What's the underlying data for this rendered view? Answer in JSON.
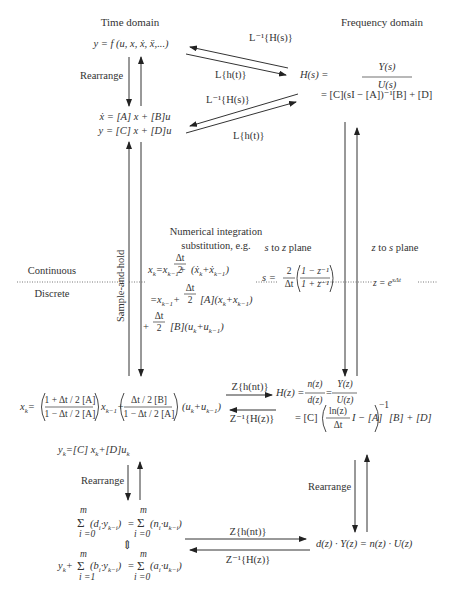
{
  "headers": {
    "time_domain": "Time domain",
    "frequency_domain": "Frequency domain"
  },
  "time_domain": {
    "ode": "y = f (u, x, ẋ, ẍ,...)",
    "state_space_1": "ẋ = [A] x + [B]u",
    "state_space_2": "y = [C] x + [D]u",
    "rearrange": "Rearrange"
  },
  "frequency_domain": {
    "transfer_function_lhs": "H(s) =",
    "transfer_function_num": "Y(s)",
    "transfer_function_den": "U(s)",
    "state_space_tf": "= [C](sI − [A])⁻¹[B] + [D]"
  },
  "laplace_arrows": {
    "top_inverse": "L⁻¹{H(s)}",
    "top_forward": "L{h(t)}",
    "bottom_inverse": "L⁻¹{H(s)}",
    "bottom_forward": "L{h(t)}"
  },
  "boundary": {
    "continuous": "Continuous",
    "discrete": "Discrete",
    "sample_and_hold": "Sample-and-hold"
  },
  "numerical_integration": {
    "title_1": "Numerical integration",
    "title_2": "substitution, e.g.",
    "eq1": "x_k = x_{k−1} + Δt/2 (ẋ_k + ẋ_{k−1})",
    "eq1_lhs": "x",
    "eq1_rest_a": " = x",
    "eq1_rest_b": " + ",
    "eq1_tail": "(ẋ",
    "eq2_a": "= x",
    "eq2_tail": "[A](x",
    "eq3_tail": "[B](u",
    "frac_num": "Δt",
    "frac_den": "2"
  },
  "s_to_z": {
    "label": "s to z plane",
    "eq_lhs": "s =",
    "frac_num": "2",
    "frac_den": "Δt",
    "inner_num": "1 − z⁻¹",
    "inner_den": "1 + z⁻¹"
  },
  "z_to_s": {
    "label": "z to s plane",
    "eq": "z = e",
    "eq_exp": "sΔt"
  },
  "discrete_state": {
    "xk_lhs": "x",
    "frac1_num": "1 + Δt / 2 [A]",
    "frac1_den": "1 − Δt / 2 [A]",
    "mid": "x",
    "frac2_num": "Δt / 2 [B]",
    "frac2_den": "1 − Δt / 2 [A]",
    "tail": "(u",
    "output_eq": "y_k = [C] x_k + [D]u_k"
  },
  "z_arrows": {
    "top_forward": "Z{h(nt)}",
    "top_inverse": "Z⁻¹{H(z)}",
    "bottom_forward": "Z{h(nt)}",
    "bottom_inverse": "Z⁻¹{H(z)}"
  },
  "z_domain": {
    "hz_lhs": "H(z) =",
    "hz_frac1_num": "n(z)",
    "hz_frac1_den": "d(z)",
    "hz_frac2_num": "Y(z)",
    "hz_frac2_den": "U(z)",
    "hz_ss_lead": "= [C]",
    "hz_ss_frac_num": "ln(z)",
    "hz_ss_frac_den": "Δt",
    "hz_ss_mid": "I − [A]",
    "hz_ss_exp": "−1",
    "hz_ss_tail": "[B] + [D]",
    "rearrange": "Rearrange",
    "poly_eq": "d(z) · Y(z) = n(z) · U(z)"
  },
  "difference_eq": {
    "rearrange": "Rearrange",
    "sum1": "Σ (d_i · y_{k−i}) = Σ (n_i · u_{k−i})",
    "sum1_lhs": "(d",
    "sum1_rhs": "(n",
    "equiv": "⇕",
    "sum2_lead": "y",
    "sum2_lhs": "(b",
    "sum2_rhs": "(a",
    "sum_top": "m",
    "sum_bottom_0": "i =0",
    "sum_bottom_1": "i =1"
  }
}
